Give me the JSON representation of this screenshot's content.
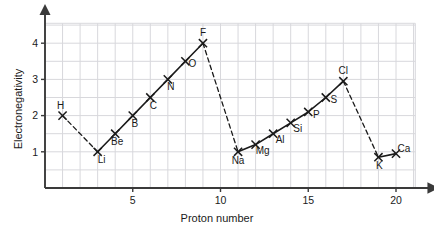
{
  "chart_data": {
    "type": "line",
    "title": "",
    "xlabel": "Proton number",
    "ylabel": "Electronegativity",
    "xlim": [
      0,
      21.5
    ],
    "ylim": [
      0,
      4.6
    ],
    "xticks": [
      5,
      10,
      15,
      20
    ],
    "yticks": [
      1,
      2,
      3,
      4
    ],
    "xtick_labels": [
      "5",
      "10",
      "15",
      "20"
    ],
    "ytick_labels": [
      "1",
      "2",
      "3",
      "4"
    ],
    "grid": true,
    "grid_x_step": 1,
    "grid_y_step": 0.5,
    "legend": "none",
    "x": [
      1,
      3,
      4,
      5,
      6,
      7,
      8,
      9,
      11,
      12,
      13,
      14,
      15,
      16,
      17,
      19,
      20
    ],
    "values": [
      2.0,
      1.0,
      1.5,
      2.0,
      2.5,
      3.0,
      3.5,
      4.0,
      1.0,
      1.2,
      1.5,
      1.8,
      2.1,
      2.5,
      2.95,
      0.85,
      0.95
    ],
    "point_labels": [
      "H",
      "Li",
      "Be",
      "B",
      "C",
      "N",
      "O",
      "F",
      "Na",
      "Mg",
      "Al",
      "Si",
      "P",
      "S",
      "Cl",
      "K",
      "Ca"
    ],
    "label_offsets": [
      [
        -2,
        -7
      ],
      [
        4,
        11
      ],
      [
        2,
        11
      ],
      [
        2,
        11
      ],
      [
        3,
        11
      ],
      [
        3,
        11
      ],
      [
        7,
        6
      ],
      [
        0,
        -7
      ],
      [
        0,
        12
      ],
      [
        7,
        9
      ],
      [
        7,
        9
      ],
      [
        7,
        9
      ],
      [
        8,
        6
      ],
      [
        8,
        5
      ],
      [
        0,
        -7
      ],
      [
        1,
        12
      ],
      [
        8,
        -2
      ]
    ],
    "marker": "x",
    "series": [
      {
        "name": "period-1-to-2-transition",
        "style": "dashed",
        "x": [
          1,
          3
        ],
        "values": [
          2.0,
          1.0
        ]
      },
      {
        "name": "period-2-trend",
        "style": "solid",
        "x": [
          3,
          4,
          5,
          6,
          7,
          8,
          9
        ],
        "values": [
          1.0,
          1.5,
          2.0,
          2.5,
          3.0,
          3.5,
          4.0
        ]
      },
      {
        "name": "period-2-to-3-transition",
        "style": "dashed",
        "x": [
          9,
          11
        ],
        "values": [
          4.0,
          1.0
        ]
      },
      {
        "name": "period-3-trend",
        "style": "solid",
        "x": [
          11,
          12,
          13,
          14,
          15,
          16,
          17
        ],
        "values": [
          1.0,
          1.2,
          1.5,
          1.8,
          2.1,
          2.5,
          2.95
        ]
      },
      {
        "name": "period-3-to-4-transition",
        "style": "dashed",
        "x": [
          17,
          19
        ],
        "values": [
          2.95,
          0.85
        ]
      },
      {
        "name": "period-4-trend",
        "style": "solid",
        "x": [
          19,
          20
        ],
        "values": [
          0.85,
          0.95
        ]
      }
    ]
  },
  "colors": {
    "axis": "#3a3a3a",
    "grid": "#d8d8dc",
    "plot_line": "#1a1a1a",
    "text": "#1a1a1a",
    "background": "#ffffff"
  }
}
